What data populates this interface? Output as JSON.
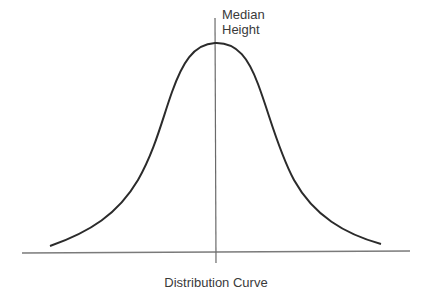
{
  "diagram": {
    "title": "Distribution Curve",
    "median_label": {
      "line1": "Median",
      "line2": "Height"
    },
    "colors": {
      "curve": "#2b2b2b",
      "axis": "#7a7a7a",
      "text": "#3a3a3a",
      "background": "#ffffff"
    },
    "shape": "bell-curve (normal distribution)"
  }
}
